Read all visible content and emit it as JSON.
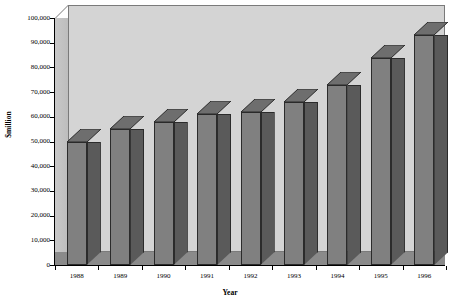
{
  "chart_data": {
    "type": "bar",
    "title": "",
    "xlabel": "Year",
    "ylabel": "$million",
    "categories": [
      "1988",
      "1989",
      "1990",
      "1991",
      "1992",
      "1993",
      "1994",
      "1995",
      "1996"
    ],
    "values": [
      50000,
      55000,
      58000,
      61000,
      62000,
      66000,
      73000,
      84000,
      93000
    ],
    "ylim": [
      0,
      100000
    ],
    "ytick_labels": [
      "100,000",
      "90,000",
      "80,000",
      "70,000",
      "60,000",
      "50,000",
      "40,000",
      "30,000",
      "20,000",
      "10,000",
      "0"
    ],
    "ytick_values": [
      100000,
      90000,
      80000,
      70000,
      60000,
      50000,
      40000,
      30000,
      20000,
      10000,
      0
    ],
    "grid": false,
    "legend": "none",
    "style": "3d-column",
    "colors": {
      "bar_front": "#808080",
      "bar_side": "#5a5a5a",
      "bar_top": "#6e6e6e",
      "bar_outline": "#2b2b2b",
      "back_wall": "#d4d4d4",
      "left_wall": "#c2c2c2",
      "floor": "#8a8a8a",
      "axis": "#000000",
      "text": "#000000",
      "background": "#ffffff"
    }
  }
}
